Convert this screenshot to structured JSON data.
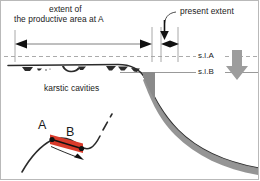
{
  "figure": {
    "title_top_left_line1": "extent of",
    "title_top_left_line2": "the productive area at  A",
    "title_top_right": "present extent",
    "cavities_label": "karstic cavities",
    "sea_level_a": "s.l.A",
    "sea_level_b": "s.l.B",
    "point_a": "A",
    "point_b": "B",
    "colors": {
      "red_band": "#D93B2B",
      "line_dark": "#1a1a1a",
      "grey_fill": "#8a8a8a",
      "grey_arrow": "#9a9a9a",
      "guide_line": "#9e9e9e",
      "frame": "#b9b9b9",
      "background": "#ffffff"
    },
    "icons": {
      "sea_level_drop": "down-arrow-icon",
      "present_extent_pointer": "curved-leader-arrow-icon",
      "extent_span": "double-headed-arrow-icon",
      "present_span": "double-headed-arrow-icon",
      "uplift": "small-arrow-icon"
    }
  }
}
